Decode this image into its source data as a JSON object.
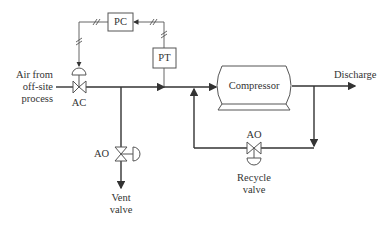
{
  "diagram": {
    "type": "process-instrumentation-diagram",
    "inlet": {
      "label_line1": "Air from",
      "label_line2": "off-site",
      "label_line3": "process"
    },
    "inlet_valve": {
      "label": "AC"
    },
    "controller": {
      "label": "PC"
    },
    "transmitter": {
      "label": "PT"
    },
    "compressor": {
      "label": "Compressor"
    },
    "discharge": {
      "label": "Discharge"
    },
    "vent_valve": {
      "action": "AO",
      "label_line1": "Vent",
      "label_line2": "valve"
    },
    "recycle_valve": {
      "action": "AO",
      "label_line1": "Recycle",
      "label_line2": "valve"
    },
    "colors": {
      "line": "#333333",
      "signal": "#555555",
      "background": "#ffffff"
    }
  }
}
